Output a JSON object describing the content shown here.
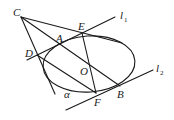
{
  "diagram": {
    "type": "geometry",
    "points": {
      "C": "C",
      "E": "E",
      "A": "A",
      "D": "D",
      "O": "O",
      "F": "F",
      "B": "B"
    },
    "lines": {
      "l1": "l",
      "l1_sub": "1",
      "l2": "l",
      "l2_sub": "2"
    },
    "angle_label": "α",
    "colors": {
      "stroke": "#1a1a1a",
      "background": "#ffffff"
    }
  }
}
